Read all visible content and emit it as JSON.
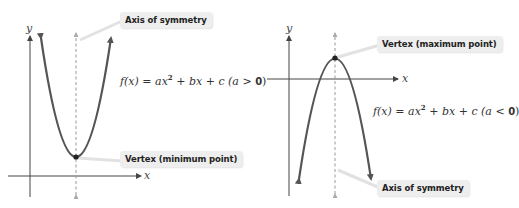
{
  "colors": {
    "curve": "#555555",
    "axis": "#444444",
    "symmetry_axis": "#999999",
    "label_bg": "#eeeeee",
    "leader_line": "#dddddd",
    "vertex_dot": "#222222"
  },
  "left_panel": {
    "title": "Parabola opening upward",
    "axis_labels": {
      "x": "x",
      "y": "y"
    },
    "symmetry_label": "Axis of symmetry",
    "vertex_label": "Vertex (minimum point)",
    "formula": {
      "lhs": "f(x)",
      "eq": "=",
      "a": "ax",
      "exp": "2",
      "rest": "+ bx + c",
      "cond_open": "(a",
      "cond_op": ">",
      "cond_val": "0",
      "cond_close": ")"
    }
  },
  "right_panel": {
    "title": "Parabola opening downward",
    "axis_labels": {
      "x": "x",
      "y": "y"
    },
    "symmetry_label": "Axis of symmetry",
    "vertex_label": "Vertex (maximum point)",
    "formula": {
      "lhs": "f(x)",
      "eq": "=",
      "a": "ax",
      "exp": "2",
      "rest": "+ bx + c",
      "cond_open": "(a",
      "cond_op": "<",
      "cond_val": "0",
      "cond_close": ")"
    }
  }
}
